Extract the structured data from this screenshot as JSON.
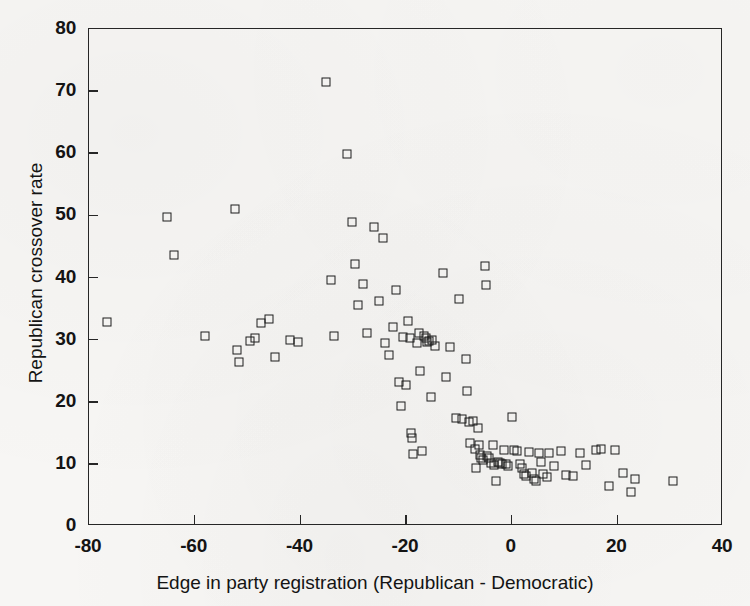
{
  "figure": {
    "background_color": "#f7f6f4",
    "ink_color": "#1d1d1d",
    "width": 750,
    "height": 606
  },
  "chart_data": {
    "type": "scatter",
    "title": "",
    "xlabel": "Edge in party registration (Republican - Democratic)",
    "ylabel": "Republican crossover rate",
    "xlim": [
      -80,
      40
    ],
    "ylim": [
      0,
      80
    ],
    "xticks": [
      -80,
      -60,
      -40,
      -20,
      0,
      20,
      40
    ],
    "xticklabels": [
      "-80",
      "-60",
      "-40",
      "-20",
      "0",
      "20",
      "40"
    ],
    "yticks": [
      0,
      10,
      20,
      30,
      40,
      50,
      60,
      70,
      80
    ],
    "yticklabels": [
      "0",
      "10",
      "20",
      "30",
      "40",
      "50",
      "60",
      "70",
      "80"
    ],
    "grid": false,
    "legend": null,
    "marker": "open-square",
    "marker_color": "#1d1d1d",
    "n_points": 111,
    "series": [
      {
        "name": "States / counties",
        "points": [
          [
            -76.5,
            32.8
          ],
          [
            -65.2,
            49.7
          ],
          [
            -64.0,
            43.6
          ],
          [
            -58.0,
            30.6
          ],
          [
            -52.3,
            51.0
          ],
          [
            -52.0,
            28.4
          ],
          [
            -51.6,
            26.4
          ],
          [
            -49.6,
            29.8
          ],
          [
            -48.6,
            30.2
          ],
          [
            -47.4,
            32.6
          ],
          [
            -46.0,
            33.4
          ],
          [
            -44.8,
            27.2
          ],
          [
            -42.0,
            29.9
          ],
          [
            -40.4,
            29.6
          ],
          [
            -35.2,
            71.4
          ],
          [
            -34.2,
            39.6
          ],
          [
            -33.6,
            30.6
          ],
          [
            -31.2,
            59.8
          ],
          [
            -30.2,
            49.0
          ],
          [
            -29.6,
            42.1
          ],
          [
            -29.0,
            35.5
          ],
          [
            -28.2,
            38.9
          ],
          [
            -27.4,
            31.1
          ],
          [
            -26.0,
            48.2
          ],
          [
            -25.2,
            36.2
          ],
          [
            -24.4,
            46.4
          ],
          [
            -24.0,
            29.4
          ],
          [
            -23.2,
            27.6
          ],
          [
            -22.4,
            32.0
          ],
          [
            -21.8,
            38.0
          ],
          [
            -21.4,
            23.2
          ],
          [
            -21.0,
            19.3
          ],
          [
            -20.6,
            30.5
          ],
          [
            -20.0,
            22.7
          ],
          [
            -19.6,
            33.0
          ],
          [
            -19.2,
            30.2
          ],
          [
            -19.0,
            14.9
          ],
          [
            -18.8,
            14.2
          ],
          [
            -18.6,
            11.6
          ],
          [
            -18.0,
            29.5
          ],
          [
            -17.6,
            31.0
          ],
          [
            -17.4,
            25.0
          ],
          [
            -17.0,
            12.0
          ],
          [
            -16.6,
            30.6
          ],
          [
            -16.2,
            30.3
          ],
          [
            -16.0,
            29.6
          ],
          [
            -15.6,
            29.8
          ],
          [
            -15.2,
            20.8
          ],
          [
            -15.0,
            29.9
          ],
          [
            -14.6,
            29.0
          ],
          [
            -13.0,
            40.8
          ],
          [
            -12.4,
            24.0
          ],
          [
            -11.6,
            28.8
          ],
          [
            -10.6,
            17.4
          ],
          [
            -10.0,
            36.6
          ],
          [
            -9.4,
            17.2
          ],
          [
            -8.6,
            26.9
          ],
          [
            -8.4,
            21.8
          ],
          [
            -8.0,
            16.8
          ],
          [
            -7.8,
            13.4
          ],
          [
            -7.4,
            16.9
          ],
          [
            -7.0,
            12.4
          ],
          [
            -6.8,
            9.4
          ],
          [
            -6.4,
            15.8
          ],
          [
            -6.2,
            13.0
          ],
          [
            -6.0,
            11.4
          ],
          [
            -5.8,
            11.0
          ],
          [
            -5.4,
            10.6
          ],
          [
            -5.0,
            41.9
          ],
          [
            -4.8,
            38.8
          ],
          [
            -4.6,
            11.2
          ],
          [
            -4.2,
            10.9
          ],
          [
            -4.0,
            10.2
          ],
          [
            -3.6,
            13.0
          ],
          [
            -3.4,
            9.8
          ],
          [
            -3.0,
            7.3
          ],
          [
            -2.6,
            10.3
          ],
          [
            -2.2,
            10.1
          ],
          [
            -1.8,
            9.9
          ],
          [
            -1.4,
            12.3
          ],
          [
            -1.0,
            10.0
          ],
          [
            -0.6,
            9.6
          ],
          [
            0.0,
            17.6
          ],
          [
            0.4,
            12.2
          ],
          [
            1.0,
            12.0
          ],
          [
            1.6,
            10.0
          ],
          [
            2.0,
            9.3
          ],
          [
            2.4,
            8.4
          ],
          [
            2.8,
            8.0
          ],
          [
            3.2,
            11.9
          ],
          [
            3.8,
            8.6
          ],
          [
            4.2,
            7.6
          ],
          [
            4.6,
            7.2
          ],
          [
            5.2,
            11.8
          ],
          [
            5.6,
            10.3
          ],
          [
            6.0,
            8.4
          ],
          [
            6.6,
            7.9
          ],
          [
            7.0,
            11.8
          ],
          [
            8.0,
            9.6
          ],
          [
            9.4,
            12.0
          ],
          [
            10.2,
            8.2
          ],
          [
            11.6,
            8.0
          ],
          [
            13.0,
            11.8
          ],
          [
            14.0,
            9.8
          ],
          [
            16.0,
            12.2
          ],
          [
            17.0,
            12.4
          ],
          [
            18.4,
            6.4
          ],
          [
            19.6,
            12.3
          ],
          [
            21.0,
            8.6
          ],
          [
            22.6,
            5.4
          ],
          [
            23.4,
            7.6
          ],
          [
            30.6,
            7.2
          ]
        ]
      }
    ]
  }
}
